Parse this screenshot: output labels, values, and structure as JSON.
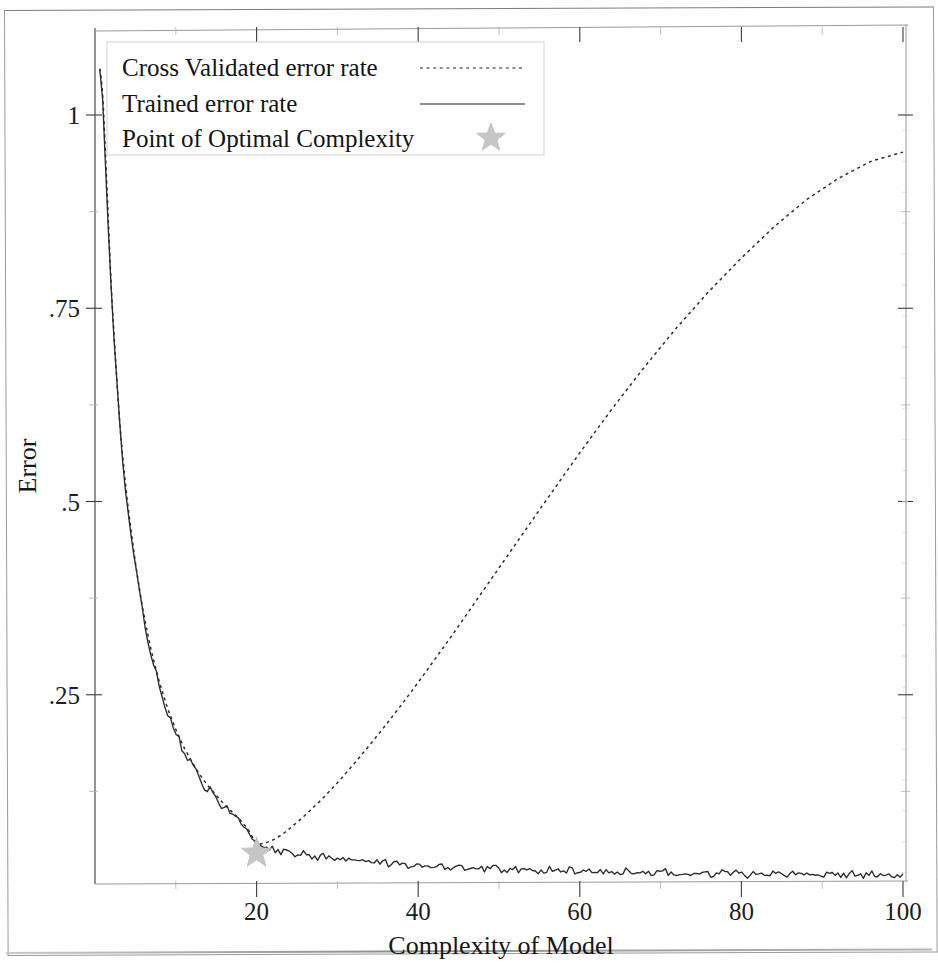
{
  "chart_data": {
    "type": "line",
    "title": "",
    "xlabel": "Complexity of Model",
    "ylabel": "Error",
    "xlim": [
      0,
      100
    ],
    "ylim": [
      0,
      1.06
    ],
    "grid": false,
    "legend_position": "top-left",
    "xticks": [
      20,
      40,
      60,
      80,
      100
    ],
    "xtick_labels": [
      "20",
      "40",
      "60",
      "80",
      "100"
    ],
    "x_minor_ticks": [
      10,
      30,
      50,
      70,
      90
    ],
    "yticks": [
      0.25,
      0.5,
      0.75,
      1
    ],
    "ytick_labels": [
      ".25",
      ".5",
      ".75",
      "1"
    ],
    "y_minor_ticks": [
      0.125,
      0.375,
      0.625,
      0.875
    ],
    "series": [
      {
        "name": "Cross Validated error rate",
        "style": "dotted",
        "color": "#2e2e2e",
        "x": [
          0.6,
          1,
          1.5,
          2,
          2.5,
          3,
          3.5,
          4,
          5,
          6,
          7,
          8,
          9,
          10,
          11,
          12,
          13,
          14,
          15,
          16,
          17,
          18,
          19,
          20,
          21,
          22,
          23,
          24,
          26,
          28,
          30,
          32,
          34,
          36,
          38,
          40,
          44,
          48,
          52,
          56,
          60,
          64,
          68,
          72,
          76,
          80,
          84,
          88,
          92,
          96,
          100
        ],
        "y": [
          1.06,
          1.02,
          0.9,
          0.78,
          0.69,
          0.61,
          0.55,
          0.5,
          0.42,
          0.355,
          0.305,
          0.265,
          0.232,
          0.205,
          0.182,
          0.163,
          0.146,
          0.132,
          0.12,
          0.108,
          0.098,
          0.088,
          0.075,
          0.056,
          0.058,
          0.062,
          0.068,
          0.076,
          0.094,
          0.114,
          0.136,
          0.16,
          0.185,
          0.211,
          0.238,
          0.266,
          0.324,
          0.384,
          0.444,
          0.504,
          0.563,
          0.62,
          0.674,
          0.725,
          0.772,
          0.815,
          0.855,
          0.89,
          0.918,
          0.94,
          0.952
        ]
      },
      {
        "name": "Trained error rate",
        "style": "solid",
        "color": "#2b2b2b",
        "x": [
          0.6,
          1,
          1.5,
          2,
          2.5,
          3,
          3.5,
          4,
          5,
          6,
          7,
          8,
          9,
          10,
          11,
          12,
          13,
          14,
          15,
          16,
          17,
          18,
          19,
          20,
          22,
          24,
          26,
          28,
          30,
          34,
          38,
          42,
          46,
          50,
          55,
          60,
          65,
          70,
          75,
          80,
          85,
          90,
          95,
          100
        ],
        "y": [
          1.06,
          1.01,
          0.89,
          0.775,
          0.685,
          0.605,
          0.545,
          0.495,
          0.415,
          0.35,
          0.3,
          0.26,
          0.228,
          0.2,
          0.178,
          0.159,
          0.142,
          0.128,
          0.116,
          0.105,
          0.095,
          0.085,
          0.072,
          0.055,
          0.049,
          0.046,
          0.043,
          0.04,
          0.038,
          0.034,
          0.031,
          0.029,
          0.027,
          0.025,
          0.023,
          0.0215,
          0.0205,
          0.0195,
          0.019,
          0.0185,
          0.018,
          0.0175,
          0.017,
          0.0165
        ]
      }
    ],
    "annotations": [
      {
        "name": "Point of Optimal Complexity",
        "marker": "star",
        "color": "#c6c6c6",
        "x": 20,
        "y": 0.045
      }
    ],
    "legend": [
      {
        "label": "Cross Validated error rate",
        "marker": "dotted-line"
      },
      {
        "label": "Trained error rate",
        "marker": "solid-line"
      },
      {
        "label": "Point of Optimal Complexity",
        "marker": "star"
      }
    ]
  }
}
